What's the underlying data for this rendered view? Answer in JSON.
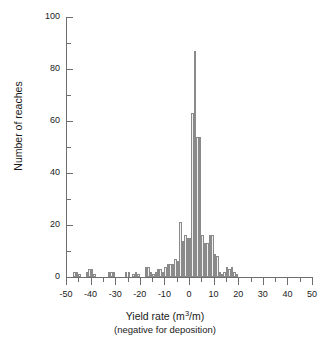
{
  "chart_data": {
    "type": "bar",
    "title": "",
    "subtitle": "",
    "xlabel": "Yield rate (m3/m)",
    "xlabel_sub": "(negative for deposition)",
    "ylabel": "Number of reaches",
    "xlim": [
      -50,
      50
    ],
    "ylim": [
      0,
      100
    ],
    "grid": false,
    "legend": null,
    "bin_width": 1,
    "x_major_ticks": [
      -50,
      -40,
      -30,
      -20,
      -10,
      0,
      10,
      20,
      30,
      40,
      50
    ],
    "x_tick_labels": [
      "-50",
      "-40",
      "-30",
      "-20",
      "-10",
      "0",
      "10",
      "20",
      "30",
      "40",
      "50"
    ],
    "x_minor_tick_step": 5,
    "y_major_ticks": [
      0,
      20,
      40,
      60,
      80,
      100
    ],
    "y_tick_labels": [
      "0",
      "20",
      "40",
      "60",
      "80",
      "100"
    ],
    "y_minor_tick_step": 10,
    "bins": [
      {
        "x": -47,
        "value": 2
      },
      {
        "x": -46,
        "value": 2
      },
      {
        "x": -45,
        "value": 1
      },
      {
        "x": -42,
        "value": 2
      },
      {
        "x": -41,
        "value": 3
      },
      {
        "x": -40,
        "value": 3
      },
      {
        "x": -39,
        "value": 1
      },
      {
        "x": -33,
        "value": 2
      },
      {
        "x": -32,
        "value": 2
      },
      {
        "x": -31,
        "value": 2
      },
      {
        "x": -26,
        "value": 2
      },
      {
        "x": -25,
        "value": 2
      },
      {
        "x": -23,
        "value": 1
      },
      {
        "x": -22,
        "value": 2
      },
      {
        "x": -21,
        "value": 1
      },
      {
        "x": -18,
        "value": 4
      },
      {
        "x": -17,
        "value": 4
      },
      {
        "x": -16,
        "value": 2
      },
      {
        "x": -15,
        "value": 1
      },
      {
        "x": -14,
        "value": 2
      },
      {
        "x": -13,
        "value": 3
      },
      {
        "x": -12,
        "value": 3
      },
      {
        "x": -11,
        "value": 2
      },
      {
        "x": -10,
        "value": 4
      },
      {
        "x": -9,
        "value": 5
      },
      {
        "x": -8,
        "value": 5
      },
      {
        "x": -7,
        "value": 5
      },
      {
        "x": -6,
        "value": 7
      },
      {
        "x": -5,
        "value": 6
      },
      {
        "x": -4,
        "value": 21
      },
      {
        "x": -3,
        "value": 14
      },
      {
        "x": -2,
        "value": 16
      },
      {
        "x": -1,
        "value": 15
      },
      {
        "x": 0,
        "value": 15
      },
      {
        "x": 1,
        "value": 63
      },
      {
        "x": 2,
        "value": 87
      },
      {
        "x": 3,
        "value": 54
      },
      {
        "x": 4,
        "value": 54
      },
      {
        "x": 5,
        "value": 16
      },
      {
        "x": 6,
        "value": 13
      },
      {
        "x": 7,
        "value": 13
      },
      {
        "x": 8,
        "value": 16
      },
      {
        "x": 9,
        "value": 16
      },
      {
        "x": 10,
        "value": 9
      },
      {
        "x": 11,
        "value": 8
      },
      {
        "x": 12,
        "value": 2
      },
      {
        "x": 13,
        "value": 1
      },
      {
        "x": 14,
        "value": 2
      },
      {
        "x": 15,
        "value": 4
      },
      {
        "x": 16,
        "value": 3
      },
      {
        "x": 17,
        "value": 4
      },
      {
        "x": 18,
        "value": 2
      },
      {
        "x": 19,
        "value": 1
      }
    ]
  }
}
